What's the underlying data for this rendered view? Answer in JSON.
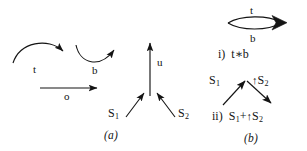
{
  "figure": {
    "background_color": "#ffffff",
    "ink_color": "#141414",
    "panels": [
      {
        "id": "a",
        "caption": "(a)"
      },
      {
        "id": "b",
        "caption": "(b)"
      }
    ]
  },
  "panel_a": {
    "arrows": [
      {
        "name": "t-arc",
        "label": "t",
        "shape": "arc-convex-up",
        "arrowhead": "end-down-right"
      },
      {
        "name": "b-arc",
        "label": "b",
        "shape": "arc-concave-up",
        "arrowhead": "end-up-right"
      },
      {
        "name": "o-arrow",
        "label": "o",
        "shape": "straight-horizontal",
        "arrowhead": "end-right"
      },
      {
        "name": "u-arrow",
        "label": "u",
        "shape": "straight-vertical",
        "arrowhead": "end-up"
      },
      {
        "name": "s1-arrow",
        "label": "S",
        "sub": "1",
        "shape": "diagonal-up-right",
        "arrowhead": "end-up-right"
      },
      {
        "name": "s2-arrow",
        "label": "S",
        "sub": "2",
        "shape": "diagonal-up-left",
        "arrowhead": "end-up-left"
      }
    ],
    "caption": "(a)"
  },
  "panel_b": {
    "item_i": {
      "top_label": "t",
      "bottom_label": "b",
      "shape": "lens-ellipse-with-arrowhead",
      "caption_prefix": "i)",
      "caption_expr_left": "t",
      "caption_operator": "∗",
      "caption_expr_right": "b",
      "caption_full": "i)  t∗b"
    },
    "item_ii": {
      "left_label": "S",
      "left_sub": "1",
      "right_tick": "↑",
      "right_label": "S",
      "right_sub": "2",
      "shape": "peak-two-arrows",
      "caption_prefix": "ii)",
      "caption_left": "S",
      "caption_left_sub": "1",
      "caption_plus": "+",
      "caption_tick": "↑",
      "caption_right": "S",
      "caption_right_sub": "2",
      "caption_full": "ii)  S₁+↑S₂"
    },
    "caption": "(b)"
  }
}
